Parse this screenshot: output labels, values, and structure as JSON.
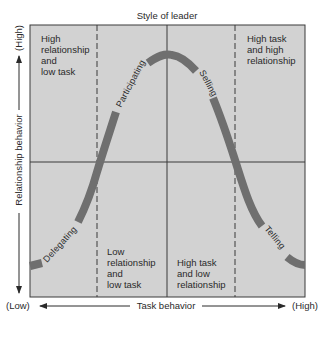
{
  "diagram": {
    "title": "Style of leader",
    "y_axis": {
      "label": "Relationship behavior",
      "high": "(High)",
      "low": "(Low)"
    },
    "x_axis": {
      "label": "Task behavior",
      "low": "(Low)",
      "high": "(High)"
    },
    "quadrants": [
      {
        "id": "q-top-left",
        "lines": [
          "High",
          "relationship",
          "and",
          "low task"
        ]
      },
      {
        "id": "q-top-right",
        "lines": [
          "High task",
          "and high",
          "relationship"
        ]
      },
      {
        "id": "q-bottom-center-left",
        "lines": [
          "Low",
          "relationship",
          "and",
          "low task"
        ]
      },
      {
        "id": "q-bottom-center-right",
        "lines": [
          "High task",
          "and low",
          "relationship"
        ]
      }
    ],
    "curve_labels": {
      "delegating": "Delegating",
      "participating": "Participating",
      "selling": "Selling",
      "telling": "Telling"
    },
    "colors": {
      "background": "#d2d2d2",
      "border": "#3a3a3a",
      "curve": "#6f6f6f",
      "text": "#2a2a2a"
    }
  }
}
